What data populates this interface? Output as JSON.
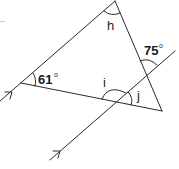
{
  "diagram": {
    "type": "geometry",
    "stroke_color": "#2a2a2a",
    "text_color": "#1a1a1a",
    "stray_mark": "..",
    "labels": {
      "angle_61": "61",
      "angle_61_deg": "o",
      "angle_75": "75",
      "angle_75_deg": "o",
      "h": "h",
      "i": "i",
      "j": "j"
    },
    "vertices": {
      "top": [
        115,
        1
      ],
      "left": [
        21,
        83
      ],
      "bottom_right": [
        162,
        111
      ]
    },
    "parallel_lines": [
      {
        "name": "triangle-left-side-extended",
        "from": [
          0,
          101
        ],
        "to": [
          115,
          1
        ],
        "arrow_at": [
          12,
          92
        ]
      },
      {
        "name": "transversal",
        "from": [
          50,
          160
        ],
        "to": [
          175,
          51
        ],
        "arrow_at": [
          60,
          151
        ]
      }
    ],
    "angles": [
      {
        "label": "61°",
        "vertex": "left",
        "value": 61
      },
      {
        "label": "75°",
        "vertex": "transversal-right-side-intersection",
        "value": 75
      },
      {
        "label": "h",
        "vertex": "top",
        "value": null
      },
      {
        "label": "i",
        "vertex": "transversal-bottom-side-intersection",
        "value": null
      },
      {
        "label": "j",
        "vertex": "transversal-bottom-side-intersection",
        "value": null
      }
    ]
  }
}
